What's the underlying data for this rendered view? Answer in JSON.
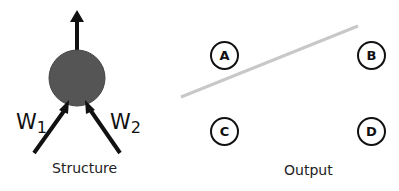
{
  "structure": {
    "caption": "Structure",
    "neuron_color": "#555555",
    "inputs": [
      {
        "label": "W",
        "subscript": "1"
      },
      {
        "label": "W",
        "subscript": "2"
      }
    ]
  },
  "output": {
    "caption": "Output",
    "nodes": [
      {
        "label": "A"
      },
      {
        "label": "B"
      },
      {
        "label": "C"
      },
      {
        "label": "D"
      }
    ],
    "decision_line_color": "#c8c8c8"
  }
}
